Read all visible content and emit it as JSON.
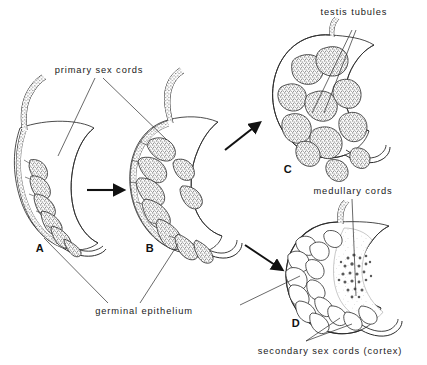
{
  "figure": {
    "background_color": "#ffffff",
    "ink_color": "#2b2b2b",
    "stipple_color": "#555555"
  },
  "labels": {
    "primary_sex_cords": "primary sex cords",
    "testis_tubules": "testis tubules",
    "medullary_cords": "medullary cords",
    "germinal_epithelium": "germinal epithelium",
    "secondary_sex_cords": "secondary sex cords (cortex)"
  },
  "panels": [
    {
      "id": "A",
      "letter": "A",
      "caption": "indifferent gonad, crescent shaped, primary sex cords along germinal epithelium"
    },
    {
      "id": "B",
      "letter": "B",
      "caption": "indifferent gonad enlarged, branching primary sex cords"
    },
    {
      "id": "C",
      "letter": "C",
      "caption": "testis, medullary cords form testis tubules"
    },
    {
      "id": "D",
      "letter": "D",
      "caption": "ovary, secondary sex cords form cortex, medullary cords regress"
    }
  ],
  "arrows": [
    {
      "name": "arrow-a-to-b",
      "direction": "right"
    },
    {
      "name": "arrow-b-to-c",
      "direction": "up-right"
    },
    {
      "name": "arrow-b-to-d",
      "direction": "down-right"
    }
  ]
}
